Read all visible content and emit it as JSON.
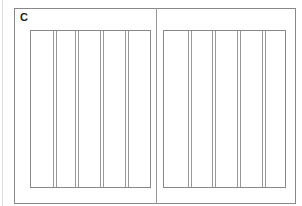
{
  "figure": {
    "label": "C",
    "panels": [
      {
        "name": "left",
        "left": 30,
        "width": 121,
        "lines": [
          22,
          25,
          44,
          47,
          69,
          72,
          94,
          97
        ]
      },
      {
        "name": "right",
        "left": 163,
        "width": 123,
        "lines": [
          24,
          27,
          48,
          51,
          73,
          76,
          98,
          101
        ]
      }
    ]
  }
}
